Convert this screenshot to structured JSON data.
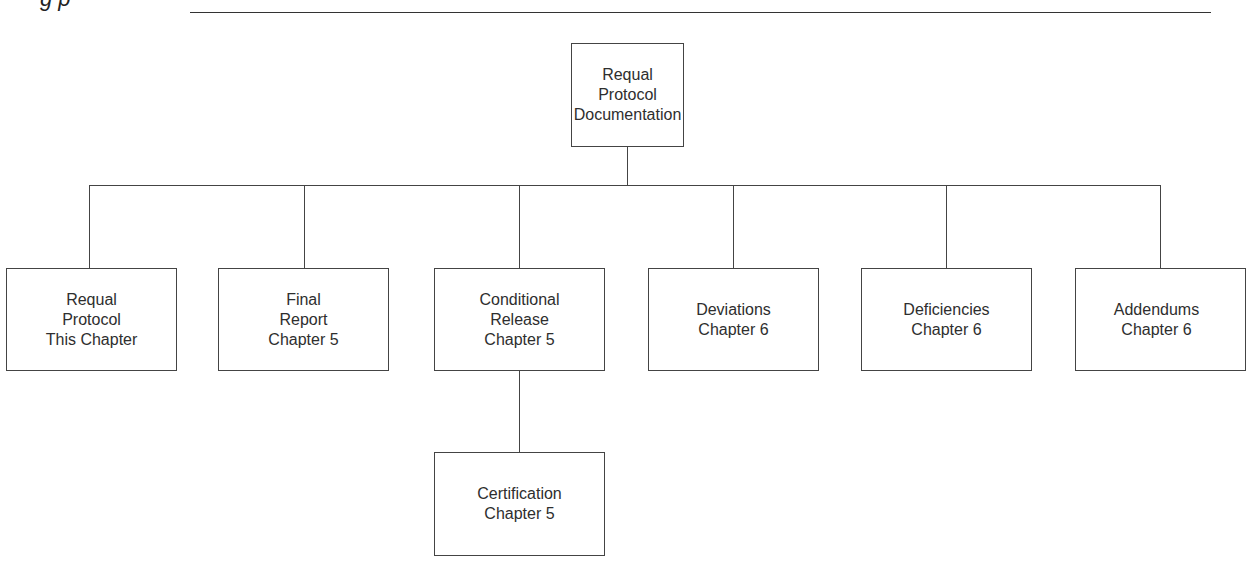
{
  "header": {
    "caption_fragment": "g                                    p",
    "rule_visible": true
  },
  "diagram": {
    "root": {
      "lines": [
        "Requal",
        "Protocol",
        "Documentation"
      ]
    },
    "children": [
      {
        "lines": [
          "Requal",
          "Protocol",
          "This Chapter"
        ]
      },
      {
        "lines": [
          "Final",
          "Report",
          "Chapter 5"
        ]
      },
      {
        "lines": [
          "Conditional",
          "Release",
          "Chapter 5"
        ]
      },
      {
        "lines": [
          "Deviations",
          "Chapter 6"
        ]
      },
      {
        "lines": [
          "Deficiencies",
          "Chapter 6"
        ]
      },
      {
        "lines": [
          "Addendums",
          "Chapter 6"
        ]
      }
    ],
    "grandchild": {
      "parent_index": 2,
      "lines": [
        "Certification",
        "Chapter 5"
      ]
    },
    "colors": {
      "line": "#444444",
      "text": "#2e2e2e",
      "background": "#ffffff"
    }
  }
}
